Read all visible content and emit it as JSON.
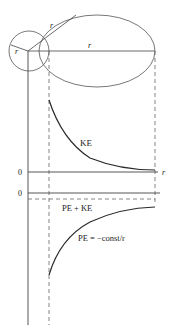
{
  "diagram": {
    "orbit_labels": {
      "small_radius": "r",
      "large_radius_diag": "r",
      "large_radius_horiz": "r"
    },
    "upper_plot": {
      "zero_label": "0",
      "x_label": "r",
      "curve_label": "KE"
    },
    "lower_plot": {
      "zero_label": "0",
      "total_label": "PE + KE",
      "curve_label": "PE = −const/r"
    },
    "colors": {
      "line": "#333333",
      "dashed": "#555555",
      "curve": "#2a2a2a"
    }
  }
}
